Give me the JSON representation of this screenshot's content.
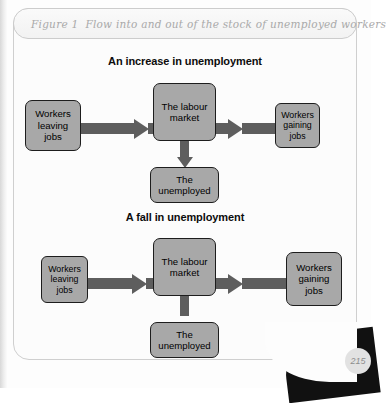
{
  "figure": {
    "number_label": "Figure 1",
    "caption": "Flow into and out of the stock of unemployed workers"
  },
  "panels": [
    {
      "id": "increase",
      "heading": "An increase in unemployment",
      "nodes": {
        "left": "Workers\nleaving\njobs",
        "left_lines": [
          "Workers",
          "leaving",
          "jobs"
        ],
        "center": "The labour\nmarket",
        "center_lines": [
          "The labour",
          "market"
        ],
        "right": "Workers\ngaining\njobs",
        "right_lines": [
          "Workers",
          "gaining",
          "jobs"
        ],
        "bottom": "The\nunemployed",
        "bottom_lines": [
          "The",
          "unemployed"
        ]
      },
      "flow_direction": "down",
      "emphasis": "left"
    },
    {
      "id": "fall",
      "heading": "A fall in unemployment",
      "nodes": {
        "left": "Workers\nleaving\njobs",
        "left_lines": [
          "Workers",
          "leaving",
          "jobs"
        ],
        "center": "The labour\nmarket",
        "center_lines": [
          "The labour",
          "market"
        ],
        "right": "Workers\ngaining\njobs",
        "right_lines": [
          "Workers",
          "gaining",
          "jobs"
        ],
        "bottom": "The\nunemployed",
        "bottom_lines": [
          "The",
          "unemployed"
        ]
      },
      "flow_direction": "up",
      "emphasis": "right"
    }
  ],
  "folio": {
    "page_number": "215"
  },
  "colors": {
    "node_fill": "#a8a8a8",
    "node_border": "#1d1d1d",
    "arrow": "#5e5e5e",
    "title_text": "#a9a9a9",
    "heading_text": "#0c0c0c",
    "figure_border": "#cfcfcf"
  }
}
